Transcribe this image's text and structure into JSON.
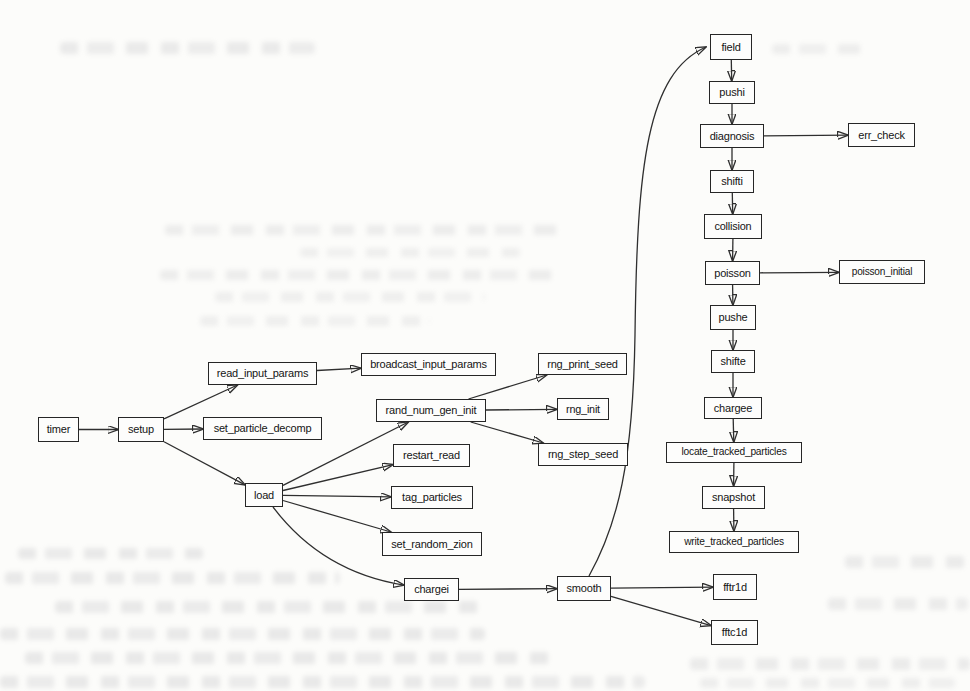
{
  "figure": {
    "type": "diagram",
    "colors": {
      "ink": "#2f2f2f",
      "box_border": "#262626",
      "box_fill": "#fdfdfc",
      "paper": "#fcfcfa"
    },
    "nodes": [
      {
        "id": "timer",
        "label": "timer",
        "x": 38,
        "y": 417,
        "w": 41,
        "h": 25
      },
      {
        "id": "setup",
        "label": "setup",
        "x": 118,
        "y": 417,
        "w": 46,
        "h": 25
      },
      {
        "id": "read_input_params",
        "label": "read_input_params",
        "x": 208,
        "y": 362,
        "w": 109,
        "h": 23
      },
      {
        "id": "set_particle_decomp",
        "label": "set_particle_decomp",
        "x": 203,
        "y": 417,
        "w": 119,
        "h": 23
      },
      {
        "id": "load",
        "label": "load",
        "x": 245,
        "y": 483,
        "w": 38,
        "h": 24
      },
      {
        "id": "broadcast_input_params",
        "label": "broadcast_input_params",
        "x": 361,
        "y": 353,
        "w": 135,
        "h": 23
      },
      {
        "id": "rand_num_gen_init",
        "label": "rand_num_gen_init",
        "x": 376,
        "y": 399,
        "w": 110,
        "h": 23
      },
      {
        "id": "rng_print_seed",
        "label": "rng_print_seed",
        "x": 538,
        "y": 353,
        "w": 89,
        "h": 22
      },
      {
        "id": "rng_init",
        "label": "rng_init",
        "x": 557,
        "y": 398,
        "w": 52,
        "h": 22
      },
      {
        "id": "rng_step_seed",
        "label": "rng_step_seed",
        "x": 538,
        "y": 443,
        "w": 90,
        "h": 23
      },
      {
        "id": "restart_read",
        "label": "restart_read",
        "x": 393,
        "y": 444,
        "w": 77,
        "h": 23
      },
      {
        "id": "tag_particles",
        "label": "tag_particles",
        "x": 391,
        "y": 486,
        "w": 82,
        "h": 23
      },
      {
        "id": "set_random_zion",
        "label": "set_random_zion",
        "x": 382,
        "y": 532,
        "w": 100,
        "h": 24
      },
      {
        "id": "chargei",
        "label": "chargei",
        "x": 404,
        "y": 578,
        "w": 55,
        "h": 23
      },
      {
        "id": "smooth",
        "label": "smooth",
        "x": 557,
        "y": 576,
        "w": 54,
        "h": 25
      },
      {
        "id": "fftr1d",
        "label": "fftr1d",
        "x": 713,
        "y": 574,
        "w": 44,
        "h": 26
      },
      {
        "id": "fftc1d",
        "label": "fftc1d",
        "x": 711,
        "y": 620,
        "w": 47,
        "h": 25
      },
      {
        "id": "field",
        "label": "field",
        "x": 710,
        "y": 34,
        "w": 42,
        "h": 26
      },
      {
        "id": "pushi",
        "label": "pushi",
        "x": 709,
        "y": 81,
        "w": 46,
        "h": 23
      },
      {
        "id": "diagnosis",
        "label": "diagnosis",
        "x": 700,
        "y": 124,
        "w": 64,
        "h": 24
      },
      {
        "id": "err_check",
        "label": "err_check",
        "x": 848,
        "y": 123,
        "w": 67,
        "h": 24
      },
      {
        "id": "shifti",
        "label": "shifti",
        "x": 710,
        "y": 170,
        "w": 44,
        "h": 23
      },
      {
        "id": "collision",
        "label": "collision",
        "x": 704,
        "y": 214,
        "w": 58,
        "h": 25
      },
      {
        "id": "poisson",
        "label": "poisson",
        "x": 705,
        "y": 261,
        "w": 55,
        "h": 24
      },
      {
        "id": "poisson_initial",
        "label": "poisson_initial",
        "x": 839,
        "y": 260,
        "w": 86,
        "h": 24
      },
      {
        "id": "pushe",
        "label": "pushe",
        "x": 710,
        "y": 305,
        "w": 46,
        "h": 25
      },
      {
        "id": "shifte",
        "label": "shifte",
        "x": 711,
        "y": 350,
        "w": 44,
        "h": 23
      },
      {
        "id": "chargee",
        "label": "chargee",
        "x": 704,
        "y": 397,
        "w": 58,
        "h": 22
      },
      {
        "id": "locate_tracked_particles",
        "label": "locate_tracked_particles",
        "x": 666,
        "y": 442,
        "w": 136,
        "h": 21
      },
      {
        "id": "snapshot",
        "label": "snapshot",
        "x": 702,
        "y": 486,
        "w": 63,
        "h": 23
      },
      {
        "id": "write_tracked_particles",
        "label": "write_tracked_particles",
        "x": 669,
        "y": 531,
        "w": 130,
        "h": 22
      }
    ],
    "edges": [
      {
        "from": "timer",
        "to": "setup"
      },
      {
        "from": "setup",
        "to": "read_input_params"
      },
      {
        "from": "setup",
        "to": "set_particle_decomp"
      },
      {
        "from": "setup",
        "to": "load"
      },
      {
        "from": "read_input_params",
        "to": "broadcast_input_params"
      },
      {
        "from": "load",
        "to": "rand_num_gen_init"
      },
      {
        "from": "load",
        "to": "restart_read"
      },
      {
        "from": "load",
        "to": "tag_particles"
      },
      {
        "from": "load",
        "to": "set_random_zion"
      },
      {
        "from": "load",
        "to": "chargei",
        "ctrl": [
          322,
          572
        ]
      },
      {
        "from": "rand_num_gen_init",
        "to": "rng_print_seed"
      },
      {
        "from": "rand_num_gen_init",
        "to": "rng_init"
      },
      {
        "from": "rand_num_gen_init",
        "to": "rng_step_seed"
      },
      {
        "from": "chargei",
        "to": "smooth"
      },
      {
        "from": "smooth",
        "to": "fftr1d"
      },
      {
        "from": "smooth",
        "to": "fftc1d"
      },
      {
        "from": "smooth",
        "to": "field",
        "path": "M 589 576 C 618 524 633 462 635 335 C 637 165 647 73 706 47"
      },
      {
        "from": "field",
        "to": "pushi"
      },
      {
        "from": "pushi",
        "to": "diagnosis"
      },
      {
        "from": "diagnosis",
        "to": "err_check"
      },
      {
        "from": "diagnosis",
        "to": "shifti"
      },
      {
        "from": "shifti",
        "to": "collision"
      },
      {
        "from": "collision",
        "to": "poisson"
      },
      {
        "from": "poisson",
        "to": "poisson_initial"
      },
      {
        "from": "poisson",
        "to": "pushe"
      },
      {
        "from": "pushe",
        "to": "shifte"
      },
      {
        "from": "shifte",
        "to": "chargee"
      },
      {
        "from": "chargee",
        "to": "locate_tracked_particles"
      },
      {
        "from": "locate_tracked_particles",
        "to": "snapshot"
      },
      {
        "from": "snapshot",
        "to": "write_tracked_particles"
      }
    ]
  }
}
